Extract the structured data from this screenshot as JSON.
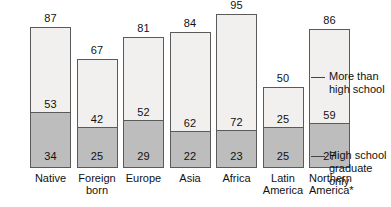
{
  "chart_data": {
    "type": "bar",
    "subtype": "stacked-bar",
    "title": "",
    "subtitle": "",
    "xlabel": "",
    "ylabel": "",
    "ylim": [
      0,
      100
    ],
    "grid": false,
    "legend_position": "right",
    "categories": [
      "Native",
      "Foreign born",
      "Europe",
      "Asia",
      "Africa",
      "Latin America",
      "Northern America*"
    ],
    "category_lines": [
      [
        "Native",
        ""
      ],
      [
        "Foreign",
        "born"
      ],
      [
        "Europe",
        ""
      ],
      [
        "Asia",
        ""
      ],
      [
        "Africa",
        ""
      ],
      [
        "Latin",
        "America"
      ],
      [
        "Northern",
        "America*"
      ]
    ],
    "series": [
      {
        "name": "More than high school",
        "color": "#f1f0ee",
        "values": [
          53,
          42,
          52,
          62,
          72,
          25,
          59
        ]
      },
      {
        "name": "High school graduate only",
        "color": "#bdbdbd",
        "values": [
          34,
          25,
          29,
          22,
          23,
          25,
          27
        ]
      }
    ],
    "totals": [
      87,
      67,
      81,
      84,
      95,
      50,
      86
    ],
    "annotations": [
      "* Northern America excludes the United States"
    ]
  },
  "legend": {
    "upper": {
      "line1": "More than",
      "line2": "high school"
    },
    "lower": {
      "line1": "High school",
      "line2": "graduate only"
    }
  },
  "colors": {
    "upper_segment": "#f1f0ee",
    "lower_segment": "#bdbdbd",
    "bar_border": "#5a5a5a",
    "text": "#111111",
    "background": "#ffffff"
  }
}
